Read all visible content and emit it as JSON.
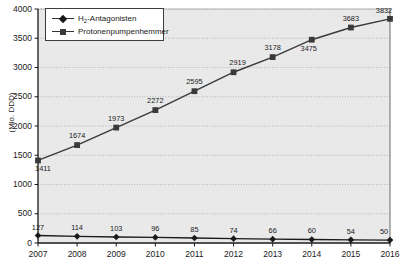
{
  "chart_data": {
    "type": "line",
    "title": "",
    "xlabel": "",
    "ylabel": "(Mio. DDD)",
    "ylim": [
      0,
      4000
    ],
    "ytick_labels": [
      "0",
      "500",
      "1000",
      "1500",
      "2000",
      "2500",
      "3000",
      "3500",
      "4000"
    ],
    "ytick_values": [
      0,
      500,
      1000,
      1500,
      2000,
      2500,
      3000,
      3500,
      4000
    ],
    "categories": [
      "2007",
      "2008",
      "2009",
      "2010",
      "2011",
      "2012",
      "2013",
      "2014",
      "2015",
      "2016"
    ],
    "grid": true,
    "legend_position": "top-left",
    "series": [
      {
        "name": "H2-Antagonisten",
        "marker": "diamond",
        "values": [
          127,
          114,
          103,
          96,
          85,
          74,
          66,
          60,
          54,
          50
        ],
        "labels": [
          "127",
          "114",
          "103",
          "96",
          "85",
          "74",
          "66",
          "60",
          "54",
          "50"
        ]
      },
      {
        "name": "Protonenpumpenhemmer",
        "marker": "square",
        "values": [
          1411,
          1674,
          1973,
          2272,
          2595,
          2919,
          3178,
          3475,
          3683,
          3832
        ],
        "labels": [
          "1411",
          "1674",
          "1973",
          "2272",
          "2595",
          "2919",
          "3178",
          "3475",
          "3683",
          "3832"
        ]
      }
    ]
  },
  "legend": {
    "items": [
      {
        "label_prefix": "H",
        "label_sub": "2",
        "label_suffix": "-Antagonisten",
        "marker": "diamond-icon"
      },
      {
        "label_prefix": "Protonenpumpenhemmer",
        "label_sub": "",
        "label_suffix": "",
        "marker": "square-icon"
      }
    ]
  },
  "colors": {
    "plot_background": "#e9e9e9",
    "gridline": "#9aa0a6",
    "axis": "#1a1a1a",
    "series_1": "#1a1a1a",
    "series_2": "#3a3a3a",
    "text": "#1a1a1a"
  }
}
